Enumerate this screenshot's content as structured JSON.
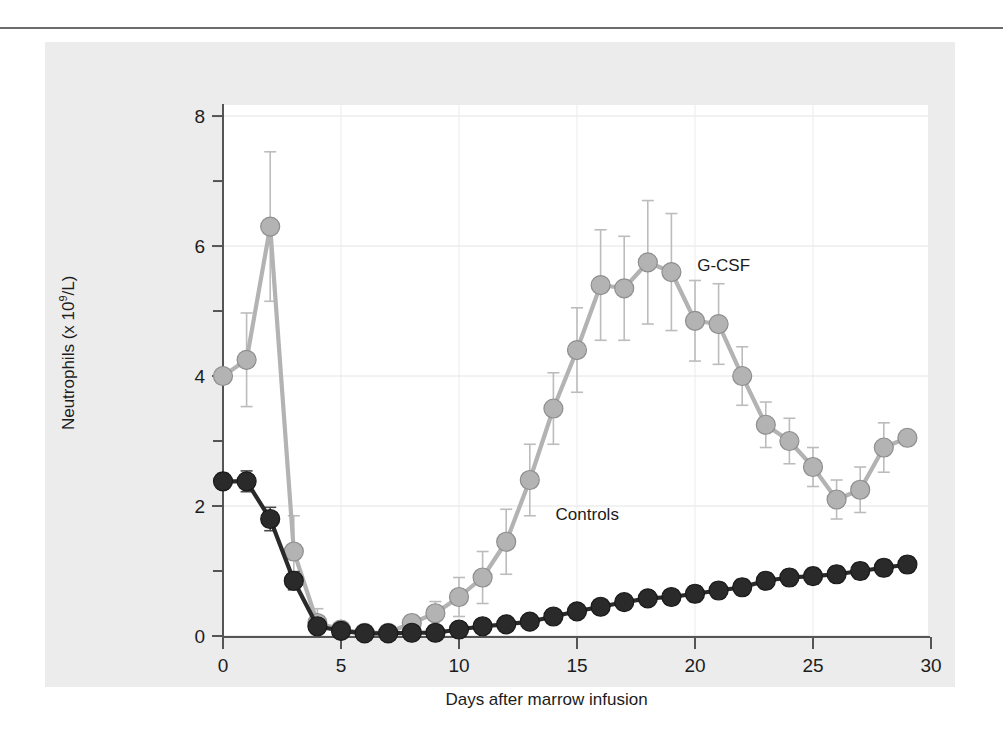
{
  "figure": {
    "background_color": "#ececec",
    "plot_background_color": "#ffffff"
  },
  "chart_data": {
    "type": "line",
    "title": "",
    "xlabel": "Days after marrow infusion",
    "ylabel": "Neutrophils (x 10⁹/L)",
    "ylabel_prefix": "Neutrophils (x 10",
    "ylabel_exponent": "9",
    "ylabel_suffix": "/L)",
    "xlim": [
      -1,
      30.5
    ],
    "ylim": [
      0,
      8
    ],
    "xticks": [
      0,
      5,
      10,
      15,
      20,
      25,
      30
    ],
    "xtick_labels": [
      "0",
      "5",
      "10",
      "15",
      "20",
      "25",
      "30"
    ],
    "yticks": [
      0,
      2,
      4,
      6,
      8
    ],
    "ytick_labels": [
      "0",
      "2",
      "4",
      "6",
      "8"
    ],
    "yticks_minor": [
      1,
      3,
      5,
      7
    ],
    "grid": "both",
    "legend_position": "inline-annotations",
    "x": [
      0,
      1,
      2,
      3,
      4,
      5,
      6,
      7,
      8,
      9,
      10,
      11,
      12,
      13,
      14,
      15,
      16,
      17,
      18,
      19,
      20,
      21,
      22,
      23,
      24,
      25,
      26,
      27,
      28,
      29
    ],
    "series": [
      {
        "name": "G-CSF",
        "color": "#b3b3b3",
        "marker": "circle-filled-grey",
        "label_x": 22.0,
        "label_y": 5.05,
        "values": [
          4.0,
          4.25,
          6.3,
          1.3,
          0.2,
          0.1,
          0.05,
          0.05,
          0.2,
          0.35,
          0.6,
          0.9,
          1.45,
          2.4,
          3.5,
          4.4,
          5.4,
          5.35,
          5.75,
          5.6,
          4.85,
          4.8,
          4.0,
          3.25,
          3.0,
          2.6,
          2.1,
          2.25,
          2.9,
          3.05
        ],
        "errors": [
          0.0,
          0.72,
          1.15,
          0.55,
          0.22,
          0.08,
          0.05,
          0.05,
          0.12,
          0.18,
          0.3,
          0.4,
          0.5,
          0.55,
          0.55,
          0.65,
          0.85,
          0.8,
          0.95,
          0.9,
          0.62,
          0.62,
          0.45,
          0.35,
          0.35,
          0.3,
          0.3,
          0.35,
          0.38,
          0.0
        ]
      },
      {
        "name": "Controls",
        "color": "#2a2a2a",
        "marker": "circle-filled-black",
        "label_x": 16.0,
        "label_y": 1.22,
        "values": [
          2.38,
          2.38,
          1.8,
          0.85,
          0.15,
          0.08,
          0.04,
          0.04,
          0.05,
          0.05,
          0.1,
          0.15,
          0.18,
          0.22,
          0.3,
          0.38,
          0.45,
          0.52,
          0.58,
          0.6,
          0.65,
          0.7,
          0.75,
          0.85,
          0.9,
          0.92,
          0.95,
          1.0,
          1.05,
          1.1
        ],
        "errors": [
          0.12,
          0.16,
          0.18,
          0.14,
          0.08,
          0.05,
          0.03,
          0.03,
          0.03,
          0.03,
          0.05,
          0.06,
          0.08,
          0.09,
          0.1,
          0.1,
          0.1,
          0.11,
          0.11,
          0.11,
          0.12,
          0.12,
          0.12,
          0.12,
          0.12,
          0.12,
          0.12,
          0.12,
          0.12,
          0.12
        ]
      }
    ]
  },
  "annotations": {
    "gcsf_label": "G-CSF",
    "controls_label": "Controls"
  }
}
